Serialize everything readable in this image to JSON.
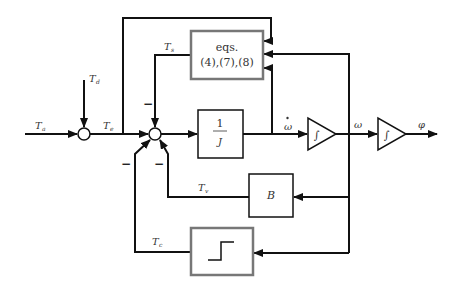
{
  "diagram": {
    "title": "",
    "colors": {
      "line": "#111111",
      "gray_box": "#777777",
      "background": "#ffffff"
    },
    "signals": {
      "Ta": {
        "main": "T",
        "sub": "a"
      },
      "Td": {
        "main": "T",
        "sub": "d"
      },
      "Te": {
        "main": "T",
        "sub": "e"
      },
      "Ts": {
        "main": "T",
        "sub": "s"
      },
      "Tv": {
        "main": "T",
        "sub": "v"
      },
      "Tc": {
        "main": "T",
        "sub": "c"
      },
      "omega_dot": "ω",
      "omega": "ω",
      "phi": "φ"
    },
    "blocks": {
      "eqs": {
        "line1": "eqs.",
        "line2": "(4),(7),(8)"
      },
      "inertia": {
        "num": "1",
        "den": "J"
      },
      "damping": {
        "label": "B"
      },
      "integrator1": {
        "symbol": "∫"
      },
      "integrator2": {
        "symbol": "∫"
      },
      "friction_step": {
        "symbol": "step"
      }
    },
    "signs": {
      "ts_minus": "−",
      "tc_minus": "−",
      "tv_minus": "−"
    }
  }
}
